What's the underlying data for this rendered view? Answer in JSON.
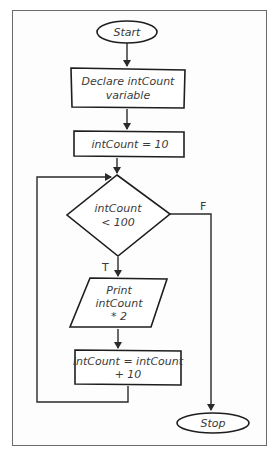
{
  "diagram": {
    "type": "flowchart",
    "nodes": {
      "start": {
        "shape": "terminator",
        "label": "Start"
      },
      "declare": {
        "shape": "process",
        "lines": [
          "Declare intCount",
          "variable"
        ]
      },
      "init": {
        "shape": "process",
        "label": "intCount = 10"
      },
      "condition": {
        "shape": "decision",
        "lines": [
          "intCount",
          "< 100"
        ]
      },
      "print": {
        "shape": "input-output",
        "lines": [
          "Print",
          "intCount",
          "* 2"
        ]
      },
      "increment": {
        "shape": "process",
        "lines": [
          "intCount = intCount",
          "+ 10"
        ]
      },
      "stop": {
        "shape": "terminator",
        "label": "Stop"
      }
    },
    "edges": {
      "true_label": "T",
      "false_label": "F"
    },
    "colors": {
      "stroke": "#1e1e1e",
      "text": "#3a3a3a",
      "frame": "#6a6a6a",
      "background": "#ffffff"
    }
  }
}
